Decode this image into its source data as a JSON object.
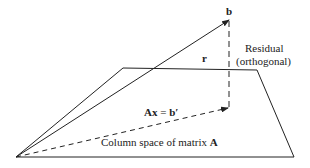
{
  "diagram": {
    "labels": {
      "b": "b",
      "r": "r",
      "residual_line1": "Residual",
      "residual_line2": "(orthogonal)",
      "ax_bold": "Ax",
      "ax_eq": " = ",
      "ax_bprime": "b′",
      "column_space_prefix": "Column space of matrix ",
      "column_space_matrix": "A"
    },
    "colors": {
      "stroke": "#222222",
      "background": "#ffffff"
    }
  }
}
